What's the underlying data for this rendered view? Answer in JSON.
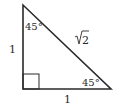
{
  "diagram": {
    "type": "right-isosceles-triangle",
    "labels": {
      "top_angle": "45°",
      "bottom_right_angle": "45°",
      "left_side": "1",
      "bottom_side": "1",
      "hypotenuse_radicand": "2",
      "hypotenuse": "√2"
    },
    "colors": {
      "stroke": "#2a2a2a",
      "background": "#ffffff"
    }
  }
}
